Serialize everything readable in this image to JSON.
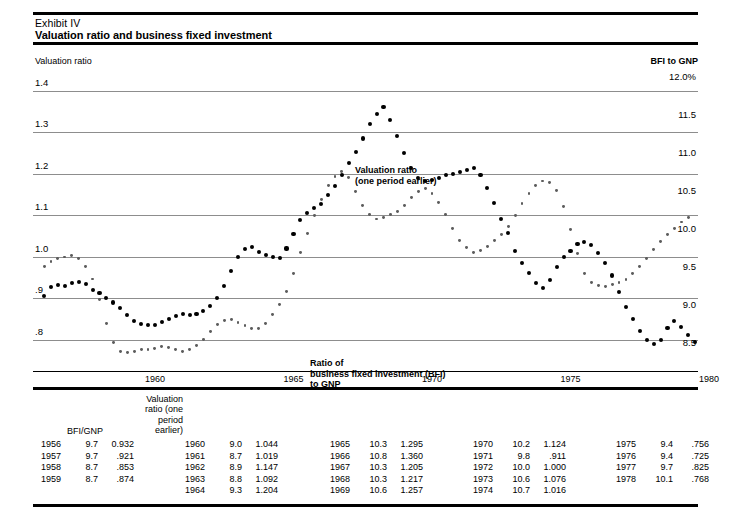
{
  "header": {
    "exhibit": "Exhibit IV",
    "title": "Valuation ratio and business fixed investment"
  },
  "axis_titles": {
    "left": "Valuation ratio",
    "right": "BFI to GNP"
  },
  "annotations": {
    "valuation": "Valuation ratio\n(one period earlier)",
    "bfi": "Ratio of\nbusiness fixed investment (BFI)\nto GNP"
  },
  "table": {
    "header_valuation": "Valuation\nratio (one\nperiod\nearlier)",
    "header_bfignp": "BFI/GNP",
    "columns": [
      [
        {
          "year": "1956",
          "bfi": "9.7",
          "vr": "0.932"
        },
        {
          "year": "1957",
          "bfi": "9.7",
          "vr": ".921"
        },
        {
          "year": "1958",
          "bfi": "8.7",
          "vr": ".853"
        },
        {
          "year": "1959",
          "bfi": "8.7",
          "vr": ".874"
        }
      ],
      [
        {
          "year": "1960",
          "bfi": "9.0",
          "vr": "1.044"
        },
        {
          "year": "1961",
          "bfi": "8.7",
          "vr": "1.019"
        },
        {
          "year": "1962",
          "bfi": "8.9",
          "vr": "1.147"
        },
        {
          "year": "1963",
          "bfi": "8.8",
          "vr": "1.092"
        },
        {
          "year": "1964",
          "bfi": "9.3",
          "vr": "1.204"
        }
      ],
      [
        {
          "year": "1965",
          "bfi": "10.3",
          "vr": "1.295"
        },
        {
          "year": "1966",
          "bfi": "10.8",
          "vr": "1.360"
        },
        {
          "year": "1967",
          "bfi": "10.3",
          "vr": "1.205"
        },
        {
          "year": "1968",
          "bfi": "10.3",
          "vr": "1.217"
        },
        {
          "year": "1969",
          "bfi": "10.6",
          "vr": "1.257"
        }
      ],
      [
        {
          "year": "1970",
          "bfi": "10.2",
          "vr": "1.124"
        },
        {
          "year": "1971",
          "bfi": "9.8",
          "vr": ".911"
        },
        {
          "year": "1972",
          "bfi": "10.0",
          "vr": "1.000"
        },
        {
          "year": "1973",
          "bfi": "10.6",
          "vr": "1.076"
        },
        {
          "year": "1974",
          "bfi": "10.7",
          "vr": "1.016"
        }
      ],
      [
        {
          "year": "1975",
          "bfi": "9.4",
          "vr": ".756"
        },
        {
          "year": "1976",
          "bfi": "9.4",
          "vr": ".725"
        },
        {
          "year": "1977",
          "bfi": "9.7",
          "vr": ".825"
        },
        {
          "year": "1978",
          "bfi": "10.1",
          "vr": ".768"
        }
      ]
    ]
  },
  "chart_data": {
    "type": "scatter",
    "title": "Valuation ratio and business fixed investment",
    "xlabel": "",
    "ylabel": "Valuation ratio",
    "y2label": "BFI to GNP",
    "grid": true,
    "legend": "in-plot annotations",
    "xlim": [
      1955.6,
      1979.6
    ],
    "xticks": [
      1960,
      1965,
      1970,
      1975,
      1980
    ],
    "xticklabels": [
      "1960",
      "1965",
      "1970",
      "1975",
      "1980"
    ],
    "ylim": [
      0.725,
      1.45
    ],
    "yticks": [
      0.8,
      0.9,
      1.0,
      1.1,
      1.2,
      1.3,
      1.4
    ],
    "yticklabels": [
      ".8",
      ".9",
      "1.0",
      "1.1",
      "1.2",
      "1.3",
      "1.4"
    ],
    "y2lim": [
      8.24,
      12.2
    ],
    "y2ticks": [
      8.5,
      9.0,
      9.5,
      10.0,
      10.5,
      11.0,
      11.5,
      12.0
    ],
    "y2ticklabels": [
      "8.5",
      "9.0",
      "9.5",
      "10.0",
      "10.5",
      "11.0",
      "11.5",
      "12.0%"
    ],
    "series": [
      {
        "name": "Valuation ratio (one period earlier)",
        "axis": "left",
        "marker": "large-dot",
        "color": "#000000",
        "x": [
          1956.0,
          1956.25,
          1956.5,
          1956.75,
          1957.0,
          1957.25,
          1957.5,
          1957.75,
          1958.0,
          1958.25,
          1958.5,
          1958.75,
          1959.0,
          1959.25,
          1959.5,
          1959.75,
          1960.0,
          1960.25,
          1960.5,
          1960.75,
          1961.0,
          1961.25,
          1961.5,
          1961.75,
          1962.0,
          1962.25,
          1962.5,
          1962.75,
          1963.0,
          1963.25,
          1963.5,
          1963.75,
          1964.0,
          1964.25,
          1964.5,
          1964.75,
          1965.0,
          1965.25,
          1965.5,
          1965.75,
          1966.0,
          1966.25,
          1966.5,
          1966.75,
          1967.0,
          1967.25,
          1967.5,
          1967.75,
          1968.0,
          1968.25,
          1968.5,
          1968.75,
          1969.0,
          1969.25,
          1969.5,
          1969.75,
          1970.0,
          1970.25,
          1970.5,
          1970.75,
          1971.0,
          1971.25,
          1971.5,
          1971.75,
          1972.0,
          1972.25,
          1972.5,
          1972.75,
          1973.0,
          1973.25,
          1973.5,
          1973.75,
          1974.0,
          1974.25,
          1974.5,
          1974.75,
          1975.0,
          1975.25,
          1975.5,
          1975.75,
          1976.0,
          1976.25,
          1976.5,
          1976.75,
          1977.0,
          1977.25,
          1977.5,
          1977.75,
          1978.0,
          1978.25,
          1978.5,
          1978.75
        ],
        "y": [
          0.905,
          0.928,
          0.932,
          0.93,
          0.938,
          0.94,
          0.935,
          0.921,
          0.912,
          0.9,
          0.89,
          0.876,
          0.86,
          0.845,
          0.838,
          0.835,
          0.836,
          0.842,
          0.85,
          0.858,
          0.862,
          0.86,
          0.862,
          0.87,
          0.882,
          0.9,
          0.93,
          0.965,
          1.0,
          1.018,
          1.024,
          1.012,
          1.005,
          1.0,
          0.998,
          1.02,
          1.055,
          1.088,
          1.105,
          1.118,
          1.128,
          1.148,
          1.17,
          1.196,
          1.225,
          1.252,
          1.285,
          1.32,
          1.345,
          1.36,
          1.33,
          1.29,
          1.25,
          1.215,
          1.19,
          1.182,
          1.184,
          1.19,
          1.196,
          1.2,
          1.205,
          1.21,
          1.214,
          1.196,
          1.165,
          1.13,
          1.092,
          1.058,
          1.015,
          0.985,
          0.96,
          0.938,
          0.925,
          0.945,
          0.975,
          1.0,
          1.015,
          1.03,
          1.036,
          1.028,
          1.01,
          0.985,
          0.955,
          0.915,
          0.88,
          0.85,
          0.822,
          0.8,
          0.79,
          0.8,
          0.828,
          0.845
        ],
        "annotation_extra": [
          {
            "x": 1979.0,
            "y": 0.83
          },
          {
            "x": 1979.25,
            "y": 0.812
          },
          {
            "x": 1979.5,
            "y": 0.795
          }
        ]
      },
      {
        "name": "Ratio of business fixed investment (BFI) to GNP",
        "axis": "right",
        "marker": "small-dot",
        "color": "#5c5c5c",
        "x": [
          1956.0,
          1956.25,
          1956.5,
          1956.75,
          1957.0,
          1957.25,
          1957.5,
          1957.75,
          1958.0,
          1958.25,
          1958.5,
          1958.75,
          1959.0,
          1959.25,
          1959.5,
          1959.75,
          1960.0,
          1960.25,
          1960.5,
          1960.75,
          1961.0,
          1961.25,
          1961.5,
          1961.75,
          1962.0,
          1962.25,
          1962.5,
          1962.75,
          1963.0,
          1963.25,
          1963.5,
          1963.75,
          1964.0,
          1964.25,
          1964.5,
          1964.75,
          1965.0,
          1965.25,
          1965.5,
          1965.75,
          1966.0,
          1966.25,
          1966.5,
          1966.75,
          1967.0,
          1967.25,
          1967.5,
          1967.75,
          1968.0,
          1968.25,
          1968.5,
          1968.75,
          1969.0,
          1969.25,
          1969.5,
          1969.75,
          1970.0,
          1970.25,
          1970.5,
          1970.75,
          1971.0,
          1971.25,
          1971.5,
          1971.75,
          1972.0,
          1972.25,
          1972.5,
          1972.75,
          1973.0,
          1973.25,
          1973.5,
          1973.75,
          1974.0,
          1974.25,
          1974.5,
          1974.75,
          1975.0,
          1975.25,
          1975.5,
          1975.75,
          1976.0,
          1976.25,
          1976.5,
          1976.75,
          1977.0,
          1977.25,
          1977.5,
          1977.75,
          1978.0,
          1978.25,
          1978.5,
          1978.75,
          1979.0,
          1979.25
        ],
        "y": [
          9.62,
          9.68,
          9.72,
          9.74,
          9.76,
          9.72,
          9.62,
          9.45,
          9.18,
          8.86,
          8.62,
          8.5,
          8.48,
          8.5,
          8.52,
          8.52,
          8.54,
          8.56,
          8.55,
          8.52,
          8.5,
          8.52,
          8.58,
          8.66,
          8.76,
          8.85,
          8.9,
          8.92,
          8.88,
          8.84,
          8.8,
          8.8,
          8.86,
          8.98,
          9.12,
          9.28,
          9.52,
          9.8,
          10.05,
          10.28,
          10.5,
          10.68,
          10.8,
          10.86,
          10.78,
          10.6,
          10.42,
          10.3,
          10.24,
          10.26,
          10.3,
          10.34,
          10.42,
          10.52,
          10.6,
          10.64,
          10.58,
          10.46,
          10.3,
          10.12,
          9.96,
          9.86,
          9.8,
          9.82,
          9.88,
          9.96,
          10.04,
          10.14,
          10.28,
          10.44,
          10.58,
          10.68,
          10.74,
          10.72,
          10.62,
          10.4,
          10.1,
          9.78,
          9.52,
          9.4,
          9.36,
          9.35,
          9.38,
          9.4,
          9.44,
          9.52,
          9.62,
          9.72,
          9.84,
          9.94,
          10.04,
          10.12,
          10.2,
          10.26
        ]
      }
    ]
  }
}
